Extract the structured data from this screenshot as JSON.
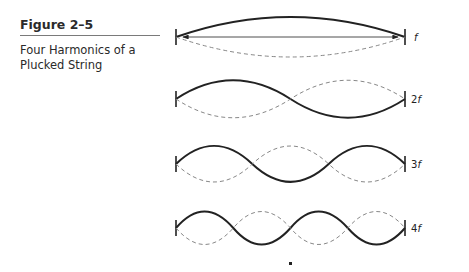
{
  "figure": {
    "number": "Figure 2–5",
    "title": "Four Harmonics of a Plucked String"
  },
  "diagram": {
    "harmonics": [
      {
        "label_num": "",
        "label_f": "f",
        "loops": 1
      },
      {
        "label_num": "2",
        "label_f": "f",
        "loops": 2
      },
      {
        "label_num": "3",
        "label_f": "f",
        "loops": 3
      },
      {
        "label_num": "4",
        "label_f": "f",
        "loops": 4
      }
    ],
    "legend": {
      "solid": "string displacement (one extreme)",
      "dashed": "string displacement (opposite extreme)"
    }
  }
}
